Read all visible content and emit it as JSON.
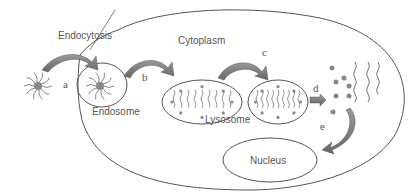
{
  "diagram": {
    "labels": {
      "endocytosis": "Endocytosis",
      "cytoplasm": "Cytoplasm",
      "endosome": "Endosome",
      "lysosome": "Lysosome",
      "nucleus": "Nucleus"
    },
    "steps": {
      "a": "a",
      "b": "b",
      "c": "c",
      "d": "d",
      "e": "e"
    },
    "colors": {
      "outline": "#555555",
      "arrow": "#777777",
      "dot": "#888888",
      "text": "#555555"
    }
  }
}
